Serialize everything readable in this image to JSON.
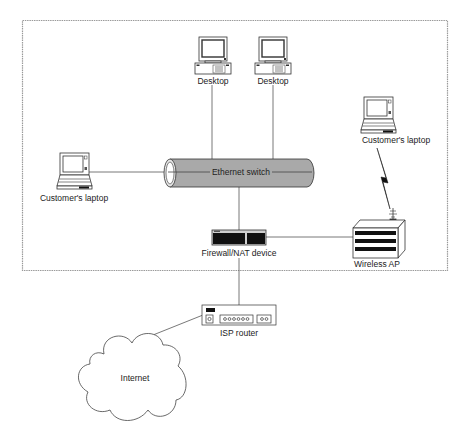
{
  "diagram": {
    "type": "network-topology",
    "boundary": {
      "style": "dotted",
      "color": "#9a9a9a"
    },
    "nodes": {
      "desktop_1": {
        "label": "Desktop",
        "kind": "desktop-computer"
      },
      "desktop_2": {
        "label": "Desktop",
        "kind": "desktop-computer"
      },
      "laptop_wired": {
        "label": "Customer's laptop",
        "kind": "laptop"
      },
      "laptop_wireless": {
        "label": "Customer's laptop",
        "kind": "laptop"
      },
      "ethernet_switch": {
        "label": "Ethernet switch",
        "kind": "switch-cylinder",
        "fill": "#a9a9a9"
      },
      "firewall": {
        "label": "Firewall/NAT device",
        "kind": "firewall"
      },
      "wireless_ap": {
        "label": "Wireless AP",
        "kind": "wireless-access-point"
      },
      "isp_router": {
        "label": "ISP router",
        "kind": "router",
        "ports": "oooooo"
      },
      "internet": {
        "label": "Internet",
        "kind": "cloud"
      }
    },
    "edges": [
      {
        "from": "desktop_1",
        "to": "ethernet_switch",
        "type": "wired"
      },
      {
        "from": "desktop_2",
        "to": "ethernet_switch",
        "type": "wired"
      },
      {
        "from": "laptop_wired",
        "to": "ethernet_switch",
        "type": "wired"
      },
      {
        "from": "ethernet_switch",
        "to": "firewall",
        "type": "wired"
      },
      {
        "from": "firewall",
        "to": "wireless_ap",
        "type": "wired"
      },
      {
        "from": "laptop_wireless",
        "to": "wireless_ap",
        "type": "wireless"
      },
      {
        "from": "firewall",
        "to": "isp_router",
        "type": "wired"
      },
      {
        "from": "isp_router",
        "to": "internet",
        "type": "wired"
      }
    ],
    "colors": {
      "line": "#555555",
      "icon_stroke": "#333333",
      "device_black": "#111111"
    }
  }
}
